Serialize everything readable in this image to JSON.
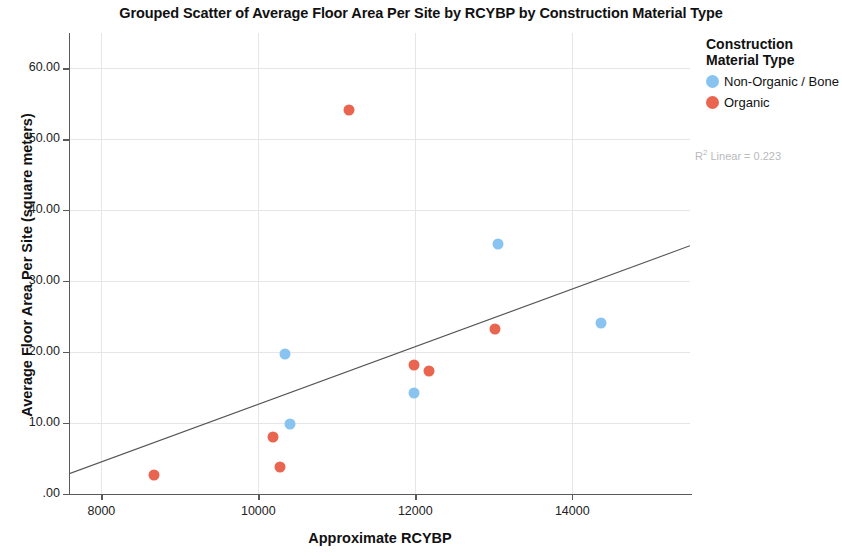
{
  "chart_data": {
    "type": "scatter",
    "title": "Grouped Scatter of Average Floor Area Per Site by RCYBP by Construction Material Type",
    "xlabel": "Approximate RCYBP",
    "ylabel": "Average Floor Area Per Site (square meters)",
    "xlim": [
      7600,
      15500
    ],
    "ylim": [
      0,
      65
    ],
    "xticks": [
      8000,
      10000,
      12000,
      14000
    ],
    "xtick_labels": [
      "8000",
      "10000",
      "12000",
      "14000"
    ],
    "yticks": [
      0,
      10,
      20,
      30,
      40,
      50,
      60
    ],
    "ytick_labels": [
      ".00",
      "10.00",
      "20.00",
      "30.00",
      "40.00",
      "50.00",
      "60.00"
    ],
    "grid": true,
    "legend_position": "right",
    "legend_title": "Construction Material Type",
    "annotation": "R² Linear = 0.223",
    "annotation_r2_value": 0.223,
    "series": [
      {
        "name": "Non-Organic / Bone",
        "color": "#89c4f0",
        "points": [
          {
            "x": 10340,
            "y": 19.8
          },
          {
            "x": 10400,
            "y": 9.9
          },
          {
            "x": 11980,
            "y": 14.3
          },
          {
            "x": 13050,
            "y": 35.2
          },
          {
            "x": 14370,
            "y": 24.1
          }
        ]
      },
      {
        "name": "Organic",
        "color": "#ea6550",
        "points": [
          {
            "x": 8670,
            "y": 2.7
          },
          {
            "x": 10190,
            "y": 8.1
          },
          {
            "x": 10280,
            "y": 3.8
          },
          {
            "x": 11150,
            "y": 54.2
          },
          {
            "x": 11980,
            "y": 18.2
          },
          {
            "x": 12180,
            "y": 17.3
          },
          {
            "x": 13020,
            "y": 23.3
          }
        ]
      }
    ],
    "fit_line": {
      "label": "Linear fit",
      "color": "#555555",
      "x_start": 7600,
      "y_start": 2.9,
      "x_end": 15500,
      "y_end": 35.0
    }
  },
  "legend": {
    "title_line1": "Construction",
    "title_line2": "Material Type",
    "entries": [
      {
        "label": "Non-Organic / Bone",
        "color": "#89c4f0"
      },
      {
        "label": "Organic",
        "color": "#ea6550"
      }
    ],
    "r2_prefix": "R",
    "r2_sup": "2",
    "r2_text": " Linear = 0.223"
  }
}
